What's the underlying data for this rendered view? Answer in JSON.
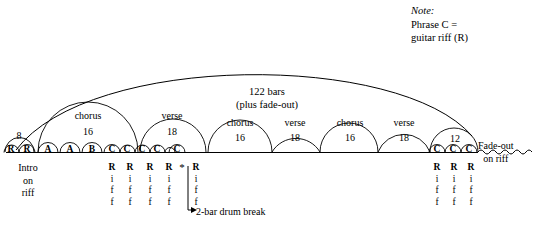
{
  "note": {
    "title": "Note:",
    "line1": "Phrase C =",
    "line2": "guitar riff (R)"
  },
  "overall": {
    "bars_text": "122 bars",
    "fade_text": "(plus fade-out)"
  },
  "intro": {
    "line1": "Intro",
    "line2": "on",
    "line3": "riff"
  },
  "fade_out": {
    "line1": "Fade-out",
    "line2": "on riff"
  },
  "drum_break": {
    "marker": "*",
    "label": "2-bar drum break"
  },
  "small_arch": {
    "count": "8"
  },
  "sections": [
    {
      "label": "chorus",
      "count": "16",
      "cx": 88
    },
    {
      "label": "verse",
      "count": "18",
      "cx": 172
    },
    {
      "label": "chorus",
      "count": "16",
      "cx": 240
    },
    {
      "label": "verse",
      "count": "18",
      "cx": 295
    },
    {
      "label": "chorus",
      "count": "16",
      "cx": 350
    },
    {
      "label": "verse",
      "count": "18",
      "cx": 404
    },
    {
      "label": "",
      "count": "12",
      "cx": 455
    }
  ],
  "phrases": [
    {
      "letter": "R",
      "cx": 11
    },
    {
      "letter": "R",
      "cx": 27
    },
    {
      "letter": "A",
      "cx": 48
    },
    {
      "letter": "A",
      "cx": 70
    },
    {
      "letter": "B",
      "cx": 92
    },
    {
      "letter": "C",
      "cx": 112
    },
    {
      "letter": "C",
      "cx": 127
    },
    {
      "letter": "C",
      "cx": 142
    },
    {
      "letter": "C",
      "cx": 157
    },
    {
      "letter": "C",
      "cx": 177
    },
    {
      "letter": "C",
      "cx": 437
    },
    {
      "letter": "C",
      "cx": 453
    },
    {
      "letter": "C",
      "cx": 469
    }
  ],
  "riff_columns": [
    {
      "cx": 112,
      "l1": "R",
      "l2": "i",
      "l3": "f",
      "l4": "f"
    },
    {
      "cx": 130,
      "l1": "R",
      "l2": "i",
      "l3": "f",
      "l4": "f"
    },
    {
      "cx": 150,
      "l1": "R",
      "l2": "i",
      "l3": "f",
      "l4": "f"
    },
    {
      "cx": 169,
      "l1": "R",
      "l2": "i",
      "l3": "f",
      "l4": "f"
    },
    {
      "cx": 196,
      "l1": "R",
      "l2": "i",
      "l3": "f",
      "l4": "f"
    },
    {
      "cx": 437,
      "l1": "R",
      "l2": "i",
      "l3": "f",
      "l4": "f"
    },
    {
      "cx": 454,
      "l1": "R",
      "l2": "i",
      "l3": "f",
      "l4": "f"
    },
    {
      "cx": 471,
      "l1": "R",
      "l2": "i",
      "l3": "f",
      "l4": "f"
    }
  ],
  "colors": {
    "ink": "#000000",
    "paper": "#ffffff"
  }
}
